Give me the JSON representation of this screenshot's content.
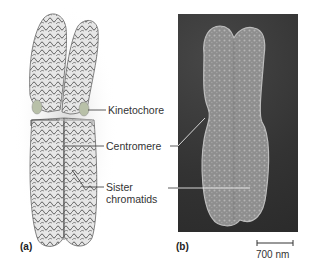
{
  "figure": {
    "panel_a": {
      "label": "(a)",
      "annotations": {
        "kinetochore": "Kinetochore",
        "centromere": "Centromere",
        "sister_line1": "Sister",
        "sister_line2": "chromatids"
      }
    },
    "panel_b": {
      "label": "(b)",
      "scale_bar": "700 nm"
    }
  },
  "colors": {
    "sem_background": "#3a3a3a",
    "chromosome_drawing": "#d9d9d9",
    "chromosome_sem": "#9a9a9a",
    "kinetochore": "#b8c0a8"
  }
}
